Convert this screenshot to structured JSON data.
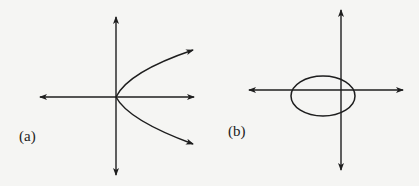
{
  "panels": [
    {
      "id": "a",
      "label": "(a)",
      "shape": "sideways parabola opening right, vertex at origin",
      "axes": {
        "origin": [
          116,
          97
        ],
        "x_range": [
          40,
          194
        ],
        "y_range": [
          17,
          175
        ]
      }
    },
    {
      "id": "b",
      "label": "(b)",
      "shape": "ellipse centered left of origin, crossing vertical axis",
      "axes": {
        "origin": [
          341,
          90
        ],
        "x_range": [
          249,
          403
        ],
        "y_range": [
          10,
          170
        ]
      },
      "ellipse": {
        "cx": 323,
        "cy": 96,
        "rx": 32,
        "ry": 20
      }
    }
  ],
  "colors": {
    "stroke": "#1e1e1e",
    "background": "#f5f5f3"
  }
}
